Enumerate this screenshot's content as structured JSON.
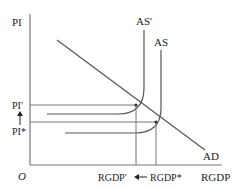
{
  "diagram": {
    "type": "aggregate-demand-aggregate-supply",
    "y_axis_label": "PI",
    "x_axis_label": "RGDP",
    "origin_label": "O",
    "curves": {
      "ad": "AD",
      "as": "AS",
      "as_shifted": "AS'"
    },
    "price_levels": {
      "new": "PI'",
      "initial": "PI*"
    },
    "output_levels": {
      "new": "RGDP'",
      "initial": "RGDP*"
    },
    "arrows": {
      "price_change": "up",
      "output_change": "left"
    },
    "colors": {
      "line": "#555555",
      "text": "#222222"
    }
  }
}
